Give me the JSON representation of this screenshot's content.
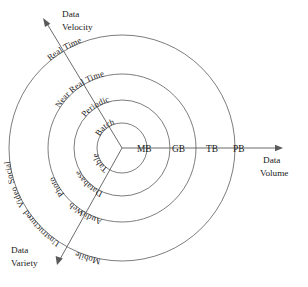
{
  "diagram": {
    "center": {
      "x": 122,
      "y": 148
    },
    "background_color": "#ffffff",
    "line_color": "#6e6e6e",
    "text_color": "#1a1a1a",
    "axes": [
      {
        "id": "data-volume",
        "label_line1": "Data",
        "label_line2": "Volume",
        "direction": "right",
        "tip": {
          "x": 283,
          "y": 148
        }
      },
      {
        "id": "data-velocity",
        "label_line1": "Data",
        "label_line2": "Velocity",
        "direction": "up-left",
        "tip": {
          "x": 43,
          "y": 18
        }
      },
      {
        "id": "data-variety",
        "label_line1": "Data",
        "label_line2": "Variety",
        "direction": "down-left",
        "tip": {
          "x": 57,
          "y": 265
        }
      }
    ],
    "rings": [
      {
        "index": 1,
        "radius": 25
      },
      {
        "index": 2,
        "radius": 48
      },
      {
        "index": 3,
        "radius": 74
      },
      {
        "index": 4,
        "radius": 113
      }
    ],
    "volume_ticks": [
      {
        "label": "MB",
        "ring": 1
      },
      {
        "label": "GB",
        "ring": 2
      },
      {
        "label": "TB",
        "ring": 3
      },
      {
        "label": "PB",
        "ring": 4
      }
    ],
    "velocity_labels": [
      {
        "label": "Batch",
        "ring": 1
      },
      {
        "label": "Periodic",
        "ring": 2
      },
      {
        "label": "Near Real Time",
        "ring": 3
      },
      {
        "label": "Real Time",
        "ring": 4
      }
    ],
    "variety_labels": [
      {
        "label": "Table",
        "ring": 1
      },
      {
        "label": "Database",
        "ring": 2
      },
      {
        "label": "Photo",
        "ring": 3
      },
      {
        "label": "Web",
        "ring": 3
      },
      {
        "label": "Audio",
        "ring": 3
      },
      {
        "label": "Social",
        "ring": 4
      },
      {
        "label": "Video",
        "ring": 4
      },
      {
        "label": "Unstructured",
        "ring": 4
      },
      {
        "label": "Mobile",
        "ring": 4
      }
    ]
  }
}
